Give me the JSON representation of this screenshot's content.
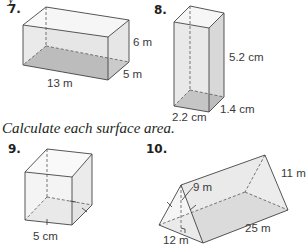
{
  "clipped_text": "y",
  "instruction": "Calculate each surface area.",
  "problems": [
    {
      "number": "7.",
      "shape": "rectangular prism",
      "labels": {
        "length": "13 m",
        "width": "5 m",
        "height": "6 m"
      }
    },
    {
      "number": "8.",
      "shape": "rectangular prism",
      "labels": {
        "length": "2.2 cm",
        "width": "1.4 cm",
        "height": "5.2 cm"
      }
    },
    {
      "number": "9.",
      "shape": "cube",
      "labels": {
        "edge": "5 cm"
      }
    },
    {
      "number": "10.",
      "shape": "triangular prism",
      "labels": {
        "triangle_height": "9 m",
        "triangle_base": "12 m",
        "length": "25 m",
        "slant_side": "11 m"
      }
    }
  ]
}
